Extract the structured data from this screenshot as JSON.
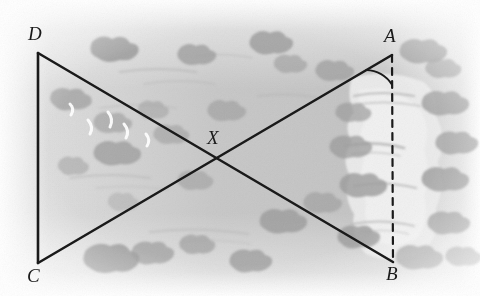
{
  "figure": {
    "width": 480,
    "height": 296,
    "background_color": "#ffffff",
    "terrain_base_color": "#c9c9c9",
    "line_color": "#1a1a1a",
    "label_color": "#1a1a1a",
    "vertices": [
      {
        "id": "D",
        "label": "D",
        "x": 38,
        "y": 53,
        "label_x": 28,
        "label_y": 24,
        "interactable": false
      },
      {
        "id": "A",
        "label": "A",
        "x": 392,
        "y": 55,
        "label_x": 384,
        "label_y": 26,
        "interactable": false
      },
      {
        "id": "C",
        "label": "C",
        "x": 38,
        "y": 263,
        "label_x": 27,
        "label_y": 266,
        "interactable": false
      },
      {
        "id": "B",
        "label": "B",
        "x": 393,
        "y": 262,
        "label_x": 386,
        "label_y": 264,
        "interactable": false
      },
      {
        "id": "X",
        "label": "X",
        "x": 217,
        "y": 158,
        "label_x": 207,
        "label_y": 128,
        "interactable": false
      }
    ],
    "segments": [
      {
        "id": "DC",
        "from": "D",
        "to": "C",
        "style": "solid",
        "width": 2.6
      },
      {
        "id": "DB",
        "from": "D",
        "to": "B",
        "style": "solid",
        "width": 2.6
      },
      {
        "id": "CA",
        "from": "C",
        "to": "A",
        "style": "solid",
        "width": 2.6
      },
      {
        "id": "AB",
        "from": "A",
        "to": "B",
        "style": "dashed",
        "width": 2.2,
        "dash": "7 6"
      }
    ],
    "angle_arc": {
      "at": "A",
      "between": [
        "A-C",
        "A-B"
      ],
      "radius": 30
    },
    "terrain": {
      "clearing_color": "#eaeaea",
      "shrub_color": "#9a9a9a",
      "water_streak_color": "#b0b0b0",
      "bird_color": "#ffffff"
    }
  }
}
